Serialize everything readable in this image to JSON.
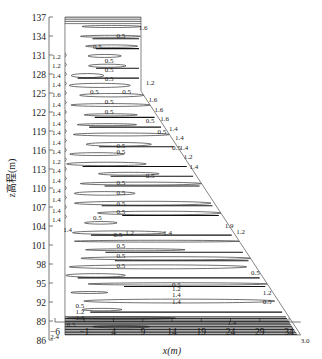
{
  "chart_data": {
    "type": "contour",
    "title": "",
    "xlabel": "x(m)",
    "ylabel": "z高程(m)",
    "xlim": [
      -6,
      36
    ],
    "ylim": [
      86,
      137
    ],
    "x_ticks": [
      "-6",
      "-1",
      "4",
      "9",
      "14",
      "19",
      "24",
      "29",
      "34"
    ],
    "y_ticks": [
      "86",
      "89",
      "92",
      "95",
      "98",
      "101",
      "104",
      "107",
      "110",
      "113",
      "116",
      "119",
      "122",
      "125",
      "128",
      "131",
      "134",
      "137"
    ],
    "grid": false,
    "legend": null,
    "contour_levels": [
      0.5,
      1.2,
      1.4,
      1.6,
      1.9,
      2.4,
      3.0
    ],
    "boundary": {
      "description": "dam cross-section outline",
      "points": [
        [
          -4.3,
          137
        ],
        [
          8.7,
          137
        ],
        [
          8.7,
          125.3
        ],
        [
          36,
          86.8
        ],
        [
          -4.3,
          86.8
        ]
      ]
    },
    "labels": [
      {
        "text": "1.6",
        "x": 8.3,
        "z": 135.5
      },
      {
        "text": "0.5",
        "x": 4.5,
        "z": 134.2
      },
      {
        "text": "0.5",
        "x": 0.5,
        "z": 132.4
      },
      {
        "text": "1.2",
        "x": -6.5,
        "z": 130.8
      },
      {
        "text": "1.2",
        "x": -6.5,
        "z": 129.4
      },
      {
        "text": "1.4",
        "x": -6.5,
        "z": 127.9
      },
      {
        "text": "1.4",
        "x": -6.5,
        "z": 126.4
      },
      {
        "text": "1.6",
        "x": -6.5,
        "z": 124.8
      },
      {
        "text": "1.4",
        "x": -6.5,
        "z": 123.3
      },
      {
        "text": "1.4",
        "x": -6.5,
        "z": 121.8
      },
      {
        "text": "1.4",
        "x": -6.5,
        "z": 120.3
      },
      {
        "text": "1.4",
        "x": -6.5,
        "z": 118.8
      },
      {
        "text": "1.4",
        "x": -6.5,
        "z": 117.3
      },
      {
        "text": "1.4",
        "x": -6.5,
        "z": 115.8
      },
      {
        "text": "1.2",
        "x": -6.5,
        "z": 114.3
      },
      {
        "text": "1.4",
        "x": -6.5,
        "z": 112.8
      },
      {
        "text": "1.4",
        "x": -6.5,
        "z": 111.2
      },
      {
        "text": "1.4",
        "x": -6.5,
        "z": 109.7
      },
      {
        "text": "1.4",
        "x": -6.5,
        "z": 108.2
      },
      {
        "text": "1.4",
        "x": -6.5,
        "z": 106.6
      },
      {
        "text": "1.4",
        "x": -6.5,
        "z": 105.1
      },
      {
        "text": "1.4",
        "x": -4.6,
        "z": 103.6
      },
      {
        "text": "0.5",
        "x": 2.5,
        "z": 130.2
      },
      {
        "text": "0.5",
        "x": 2.5,
        "z": 128.8
      },
      {
        "text": "0.5",
        "x": 2.5,
        "z": 127.3
      },
      {
        "text": "0.5",
        "x": 0.0,
        "z": 125.3
      },
      {
        "text": "0.5",
        "x": 5.5,
        "z": 125.3
      },
      {
        "text": "1.2",
        "x": 9.5,
        "z": 126.8
      },
      {
        "text": "0.5",
        "x": 2.5,
        "z": 123.8
      },
      {
        "text": "0.5",
        "x": 2.5,
        "z": 122.2
      },
      {
        "text": "1.6",
        "x": 10.0,
        "z": 124.0
      },
      {
        "text": "1.6",
        "x": 11.0,
        "z": 122.5
      },
      {
        "text": "1.6",
        "x": 12.0,
        "z": 121.0
      },
      {
        "text": "0.5",
        "x": 9.5,
        "z": 120.7
      },
      {
        "text": "1.4",
        "x": 13.5,
        "z": 119.5
      },
      {
        "text": "0.5",
        "x": 11.5,
        "z": 119.0
      },
      {
        "text": "1.4",
        "x": 14.5,
        "z": 118.0
      },
      {
        "text": "0.5",
        "x": 4.5,
        "z": 116.8
      },
      {
        "text": "0.5",
        "x": 4.5,
        "z": 115.8
      },
      {
        "text": "0.5",
        "x": 14.0,
        "z": 116.4
      },
      {
        "text": "1.4",
        "x": 15.3,
        "z": 116.5
      },
      {
        "text": "1.2",
        "x": 16.0,
        "z": 115.0
      },
      {
        "text": "1.4",
        "x": 17.0,
        "z": 113.5
      },
      {
        "text": "0.5",
        "x": 9.5,
        "z": 112.0
      },
      {
        "text": "0.5",
        "x": 4.5,
        "z": 110.9
      },
      {
        "text": "0.5",
        "x": 4.5,
        "z": 109.3
      },
      {
        "text": "0.5",
        "x": 4.5,
        "z": 107.7
      },
      {
        "text": "0.5",
        "x": 4.5,
        "z": 106.3
      },
      {
        "text": "0.5",
        "x": 0.5,
        "z": 105.5
      },
      {
        "text": "1.9",
        "x": 23.0,
        "z": 104.2
      },
      {
        "text": "1.2",
        "x": 25.0,
        "z": 103.2
      },
      {
        "text": "0.5",
        "x": 4.0,
        "z": 102.8
      },
      {
        "text": "1.2",
        "x": 6.0,
        "z": 103.0
      },
      {
        "text": "1.4",
        "x": 12.5,
        "z": 103.0
      },
      {
        "text": "0.5",
        "x": 4.5,
        "z": 101.0
      },
      {
        "text": "0.5",
        "x": 4.5,
        "z": 99.5
      },
      {
        "text": "0.5",
        "x": 4.5,
        "z": 97.8
      },
      {
        "text": "0.5",
        "x": 27.5,
        "z": 96.8
      },
      {
        "text": "0.5",
        "x": 14.0,
        "z": 94.8
      },
      {
        "text": "1.2",
        "x": 14.0,
        "z": 94.2
      },
      {
        "text": "1.4",
        "x": 14.0,
        "z": 93.2
      },
      {
        "text": "1.4",
        "x": 14.0,
        "z": 92.2
      },
      {
        "text": "1.2",
        "x": 29.5,
        "z": 93.6
      },
      {
        "text": "0.5",
        "x": 29.5,
        "z": 92.2
      },
      {
        "text": "0.5",
        "x": -2.5,
        "z": 91.6
      },
      {
        "text": "1.2",
        "x": -2.5,
        "z": 90.6
      },
      {
        "text": "1.3",
        "x": -2.5,
        "z": 89.6
      },
      {
        "text": "0.5",
        "x": -4.0,
        "z": 88.6
      },
      {
        "text": "1.4",
        "x": 23.5,
        "z": 88.9
      },
      {
        "text": "2.4",
        "x": -6.8,
        "z": 86.6
      },
      {
        "text": "3.0",
        "x": 36.0,
        "z": 86.0
      }
    ]
  },
  "axes": {
    "xlabel": "x(m)",
    "ylabel": "z高程(m)"
  }
}
